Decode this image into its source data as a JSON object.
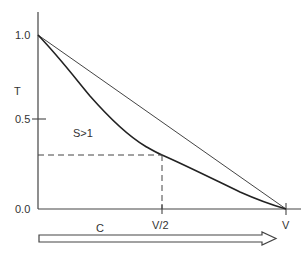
{
  "diagram": {
    "y_axis": {
      "label": "T",
      "ticks": [
        {
          "value": 1.0,
          "label": "1.0"
        },
        {
          "value": 0.5,
          "label": "0.5"
        },
        {
          "value": 0.0,
          "label": "0.0"
        }
      ]
    },
    "x_axis": {
      "ticks": [
        {
          "value": 0.5,
          "label": "V/2"
        },
        {
          "value": 1.0,
          "label": "V"
        }
      ]
    },
    "region_label": "S>1",
    "arrow_label": "C",
    "colors": {
      "line": "#333333",
      "curve": "#222222",
      "background": "#ffffff"
    },
    "series": [
      {
        "name": "straight-line",
        "points": [
          [
            0.0,
            1.0
          ],
          [
            1.0,
            0.0
          ]
        ]
      },
      {
        "name": "curve-S>1",
        "points": [
          [
            0.0,
            1.0
          ],
          [
            0.17,
            0.73
          ],
          [
            0.25,
            0.58
          ],
          [
            0.33,
            0.46
          ],
          [
            0.41,
            0.38
          ],
          [
            0.5,
            0.31
          ],
          [
            0.65,
            0.21
          ],
          [
            0.77,
            0.13
          ],
          [
            0.89,
            0.06
          ],
          [
            1.0,
            0.0
          ]
        ]
      }
    ],
    "dashed_guide": {
      "x": 0.5,
      "y": 0.31
    }
  }
}
